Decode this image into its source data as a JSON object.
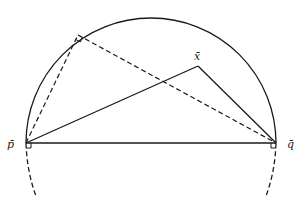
{
  "diagram": {
    "type": "geometry",
    "stroke_color": "#1a1a1a",
    "background": "#ffffff",
    "points": {
      "p": {
        "label": "p̄",
        "x": 26,
        "y": 143
      },
      "q": {
        "label": "q̄",
        "x": 276,
        "y": 143
      },
      "x": {
        "label": "x̄",
        "x": 198,
        "y": 66
      },
      "t": {
        "label": "",
        "x": 78,
        "y": 35
      }
    },
    "arc": {
      "cx": 151,
      "cy": 143,
      "r": 125,
      "style": "solid upper semicircle"
    },
    "lower_arcs": {
      "style": "dashed continuation below p and q"
    },
    "segments": [
      {
        "from": "p",
        "to": "q",
        "style": "solid"
      },
      {
        "from": "p",
        "to": "x",
        "style": "solid"
      },
      {
        "from": "x",
        "to": "q",
        "style": "solid"
      },
      {
        "from": "p",
        "to": "t",
        "style": "dashed"
      },
      {
        "from": "t",
        "to": "q",
        "style": "dashed"
      }
    ],
    "right_angle_markers": [
      "t",
      "p",
      "q"
    ]
  }
}
